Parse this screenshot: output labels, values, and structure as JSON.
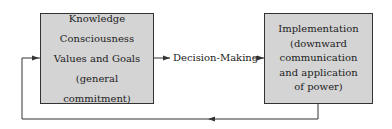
{
  "diagram": {
    "left_box": {
      "lines": [
        "Knowledge",
        "Consciousness",
        "Values and Goals",
        "(general commitment)"
      ]
    },
    "middle_label": "Decision-Making",
    "right_box": {
      "lines": [
        "Implementation",
        "(downward",
        "communication",
        "and application",
        "of power)"
      ]
    },
    "edges": [
      {
        "from": "left_box",
        "to": "middle_label",
        "type": "arrow"
      },
      {
        "from": "middle_label",
        "to": "right_box",
        "type": "arrow"
      },
      {
        "from": "right_box",
        "to": "left_box",
        "type": "feedback-arrow"
      }
    ],
    "colors": {
      "box_fill": "#d4d4d4",
      "stroke": "#333333"
    }
  }
}
